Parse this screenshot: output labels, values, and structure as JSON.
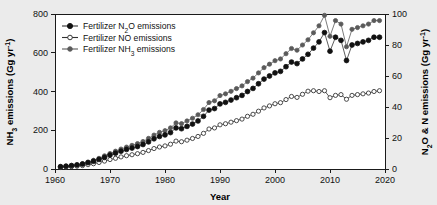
{
  "chart_data": {
    "type": "line",
    "title": "",
    "xlabel": "Year",
    "ylabel": "NH3 emissions (Gg yr-1)",
    "ylabel_right": "N2O & N emissions (Gg yr-1)",
    "xlim": [
      1960,
      2020
    ],
    "ylim": [
      0,
      800
    ],
    "ylim_right": [
      0,
      100
    ],
    "xticks": [
      1960,
      1970,
      1980,
      1990,
      2000,
      2010,
      2020
    ],
    "yticks": [
      0,
      200,
      400,
      600,
      800
    ],
    "yticks_right": [
      0,
      20,
      40,
      60,
      80,
      100
    ],
    "grid": false,
    "legend_position": "top-left",
    "colors": {
      "n2o": "#111111",
      "no": "#ffffff",
      "nh3": "#555555",
      "line": "#444444",
      "axis": "#1a1a1a",
      "page_background": "#ebebeb",
      "plot_background": "#ffffff"
    },
    "x": [
      1961,
      1962,
      1963,
      1964,
      1965,
      1966,
      1967,
      1968,
      1969,
      1970,
      1971,
      1972,
      1973,
      1974,
      1975,
      1976,
      1977,
      1978,
      1979,
      1980,
      1981,
      1982,
      1983,
      1984,
      1985,
      1986,
      1987,
      1988,
      1989,
      1990,
      1991,
      1992,
      1993,
      1994,
      1995,
      1996,
      1997,
      1998,
      1999,
      2000,
      2001,
      2002,
      2003,
      2004,
      2005,
      2006,
      2007,
      2008,
      2009,
      2010,
      2011,
      2012,
      2013,
      2014,
      2015,
      2016,
      2017,
      2018,
      2019
    ],
    "series": [
      {
        "name": "Fertilizer N2O emissions",
        "axis": "right",
        "marker": "filled-circle-black",
        "values": [
          1.5,
          1.8,
          2.2,
          2.6,
          3.2,
          4.1,
          5.0,
          6.2,
          7.5,
          9.0,
          10.2,
          11.5,
          12.6,
          13.5,
          14.5,
          15.8,
          17.5,
          19.5,
          21.0,
          22.0,
          23.5,
          26.5,
          26.0,
          27.5,
          29.0,
          31.0,
          34.0,
          38.0,
          39.0,
          42.0,
          43.0,
          44.5,
          46.0,
          47.5,
          50.0,
          52.0,
          55.0,
          58.0,
          60.0,
          62.0,
          63.0,
          66.0,
          69.0,
          68.0,
          71.0,
          74.0,
          78.0,
          82.0,
          88.0,
          76.0,
          85.0,
          83.0,
          70.0,
          80.0,
          81.0,
          82.0,
          83.0,
          85.0,
          85.0
        ]
      },
      {
        "name": "Fertilizer NO emissions",
        "axis": "right",
        "marker": "open-circle",
        "values": [
          1.0,
          1.2,
          1.5,
          1.8,
          2.2,
          2.8,
          3.4,
          4.2,
          5.1,
          6.1,
          6.9,
          7.8,
          8.6,
          9.2,
          9.9,
          10.7,
          11.9,
          13.2,
          14.2,
          14.9,
          16.0,
          18.0,
          17.6,
          18.6,
          19.7,
          21.0,
          23.0,
          25.8,
          26.5,
          28.5,
          29.2,
          30.2,
          31.2,
          32.2,
          34.0,
          35.3,
          37.3,
          39.4,
          40.7,
          42.1,
          42.8,
          44.8,
          46.8,
          46.2,
          48.2,
          50.2,
          50.5,
          50.0,
          50.5,
          46.0,
          47.5,
          48.0,
          45.0,
          47.5,
          48.0,
          48.5,
          49.0,
          50.0,
          50.5
        ]
      },
      {
        "name": "Fertilizer NH3 emissions",
        "axis": "left",
        "marker": "filled-circle-gray",
        "values": [
          12,
          15,
          18,
          22,
          28,
          36,
          45,
          55,
          68,
          80,
          92,
          103,
          113,
          122,
          131,
          142,
          158,
          175,
          189,
          198,
          212,
          238,
          234,
          248,
          262,
          280,
          307,
          343,
          352,
          379,
          388,
          401,
          415,
          429,
          451,
          469,
          496,
          523,
          541,
          559,
          568,
          595,
          622,
          613,
          640,
          667,
          703,
          739,
          793,
          685,
          766,
          748,
          631,
          721,
          730,
          739,
          748,
          766,
          766
        ]
      }
    ]
  },
  "legend": {
    "entries": [
      {
        "label": "Fertilizer N2O emissions"
      },
      {
        "label": "Fertilizer NO emissions"
      },
      {
        "label": "Fertilizer NH3 emissions"
      }
    ]
  },
  "axes": {
    "x_title": "Year",
    "left_title_parts": {
      "main": "NH",
      "sub": "3",
      "rest": " emissions (Gg yr",
      "sup": "-1",
      "close": ")"
    },
    "right_title_parts": {
      "main": "N",
      "sub": "2",
      "rest": "O & N emissions (Gg yr",
      "sup": "-1",
      "close": ")"
    },
    "xticks": [
      "1960",
      "1970",
      "1980",
      "1990",
      "2000",
      "2010",
      "2020"
    ],
    "left_yticks": [
      "800",
      "600",
      "400",
      "200",
      "0"
    ],
    "right_yticks": [
      "100",
      "80",
      "60",
      "40",
      "20",
      "0"
    ]
  }
}
